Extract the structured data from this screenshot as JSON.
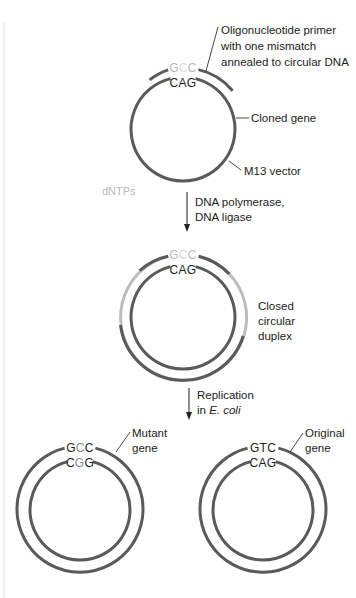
{
  "figure": {
    "panels": [
      {
        "id": "primer-annealing",
        "top_sequence": [
          "G",
          "C",
          "C"
        ],
        "top_sequence_highlight_index": 1,
        "top_sequence_faint": true,
        "bottom_sequence": "CAG",
        "callouts": {
          "primer": [
            "Oligonucleotide primer",
            "with one mismatch",
            "annealed to circular DNA"
          ],
          "cloned_gene": "Cloned gene",
          "vector": "M13 vector"
        },
        "reagent": "dNTPs"
      },
      {
        "id": "closed-circular-duplex",
        "top_sequence": [
          "G",
          "C",
          "C"
        ],
        "top_sequence_highlight_index": 1,
        "bottom_sequence": "CAG",
        "callout": [
          "Closed",
          "circular",
          "duplex"
        ]
      },
      {
        "id": "mutant",
        "top_sequence": [
          "G",
          "C",
          "C"
        ],
        "top_sequence_highlight_index": 1,
        "bottom_sequence": [
          "C",
          "G",
          "G"
        ],
        "bottom_sequence_highlight_index": 1,
        "callout": [
          "Mutant",
          "gene"
        ]
      },
      {
        "id": "original",
        "top_sequence": [
          "G",
          "T",
          "C"
        ],
        "bottom_sequence": "CAG",
        "callout": [
          "Original",
          "gene"
        ]
      }
    ],
    "steps": [
      {
        "label_lines": [
          "DNA polymerase,",
          "DNA ligase"
        ]
      },
      {
        "label_lines": [
          "Replication",
          "in "
        ],
        "italic": "E. coli"
      }
    ],
    "colors": {
      "strand_dark": "#5a5a5a",
      "strand_new_light": "#bdbdbd",
      "text": "#222222",
      "faint_text": "#b8b8b8",
      "border_line": "#e2e2e2"
    }
  }
}
